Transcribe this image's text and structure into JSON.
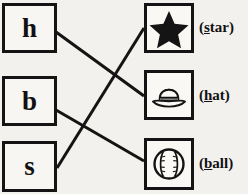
{
  "worksheet": {
    "type": "matching-exercise",
    "ink_color": "#141414",
    "paper_color": "#f2f1ee",
    "left_column": [
      {
        "id": "h",
        "letter": "h",
        "name": "letter-box-h"
      },
      {
        "id": "b",
        "letter": "b",
        "name": "letter-box-b"
      },
      {
        "id": "s",
        "letter": "s",
        "name": "letter-box-s"
      }
    ],
    "right_column": [
      {
        "id": "star",
        "icon": "star-icon",
        "label_open": "(",
        "label_initial": "s",
        "label_rest": "tar",
        "label_close": ")",
        "label_full": "(star)"
      },
      {
        "id": "hat",
        "icon": "hat-icon",
        "label_open": "(",
        "label_initial": "h",
        "label_rest": "at",
        "label_close": ")",
        "label_full": "(hat)"
      },
      {
        "id": "ball",
        "icon": "baseball-icon",
        "label_open": "(",
        "label_initial": "b",
        "label_rest": "all",
        "label_close": ")",
        "label_full": "(ball)"
      }
    ],
    "connections": [
      {
        "from": "h",
        "to": "hat"
      },
      {
        "from": "b",
        "to": "ball"
      },
      {
        "from": "s",
        "to": "star"
      }
    ]
  }
}
